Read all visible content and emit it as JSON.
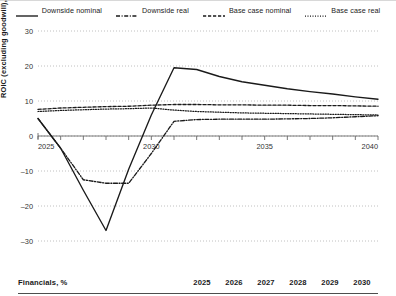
{
  "legend": {
    "items": [
      {
        "label": "Downside nominal",
        "style": "solid",
        "color": "#1a1a1a"
      },
      {
        "label": "Downside real",
        "style": "dashdot",
        "color": "#1a1a1a"
      },
      {
        "label": "Base case nominal",
        "style": "dashed",
        "color": "#1a1a1a"
      },
      {
        "label": "Base case real",
        "style": "dotted",
        "color": "#1a1a1a"
      }
    ]
  },
  "chart_data": {
    "type": "line",
    "title": "",
    "xlabel": "",
    "ylabel": "ROIC (excluding goodwill), %",
    "xlim": [
      2025,
      2040
    ],
    "ylim": [
      -32,
      32
    ],
    "yticks": [
      30,
      20,
      10,
      0,
      -10,
      -20,
      -30
    ],
    "xticks": [
      2025,
      2026,
      2027,
      2028,
      2029,
      2030,
      2031,
      2032,
      2033,
      2034,
      2035,
      2036,
      2037,
      2038,
      2039,
      2040
    ],
    "xticklabels": [
      "2025",
      "",
      "",
      "",
      "",
      "2030",
      "",
      "",
      "",
      "",
      "2035",
      "",
      "",
      "",
      "",
      "2040"
    ],
    "grid": "horizontal-dotted",
    "legend_position": "top-center",
    "x": [
      2025,
      2026,
      2027,
      2028,
      2029,
      2030,
      2031,
      2032,
      2033,
      2034,
      2035,
      2036,
      2037,
      2038,
      2039,
      2040
    ],
    "series": [
      {
        "name": "Downside nominal",
        "style": "solid",
        "color": "#1a1a1a",
        "values": [
          5.0,
          -3.5,
          -15.5,
          -27.0,
          -9.5,
          6.0,
          19.5,
          19.0,
          17.0,
          15.5,
          14.5,
          13.5,
          12.7,
          12.0,
          11.2,
          10.5
        ]
      },
      {
        "name": "Downside real",
        "style": "dashdot",
        "color": "#1a1a1a",
        "values": [
          5.0,
          -3.5,
          -12.5,
          -13.5,
          -13.5,
          -5.0,
          4.2,
          4.7,
          4.8,
          4.8,
          4.8,
          4.9,
          5.0,
          5.2,
          5.5,
          5.8
        ]
      },
      {
        "name": "Base case nominal",
        "style": "dashed",
        "color": "#1a1a1a",
        "values": [
          7.6,
          8.0,
          8.2,
          8.4,
          8.5,
          8.8,
          9.0,
          9.0,
          8.9,
          8.9,
          8.8,
          8.8,
          8.7,
          8.7,
          8.6,
          8.5
        ]
      },
      {
        "name": "Base case real",
        "style": "dotted",
        "color": "#1a1a1a",
        "values": [
          7.0,
          7.3,
          7.5,
          7.7,
          7.8,
          8.0,
          7.4,
          7.0,
          6.8,
          6.6,
          6.5,
          6.4,
          6.3,
          6.2,
          6.1,
          6.0
        ]
      }
    ]
  },
  "footer": {
    "title": "Financials, %",
    "years": [
      "2025",
      "2026",
      "2027",
      "2028",
      "2029",
      "2030"
    ]
  }
}
